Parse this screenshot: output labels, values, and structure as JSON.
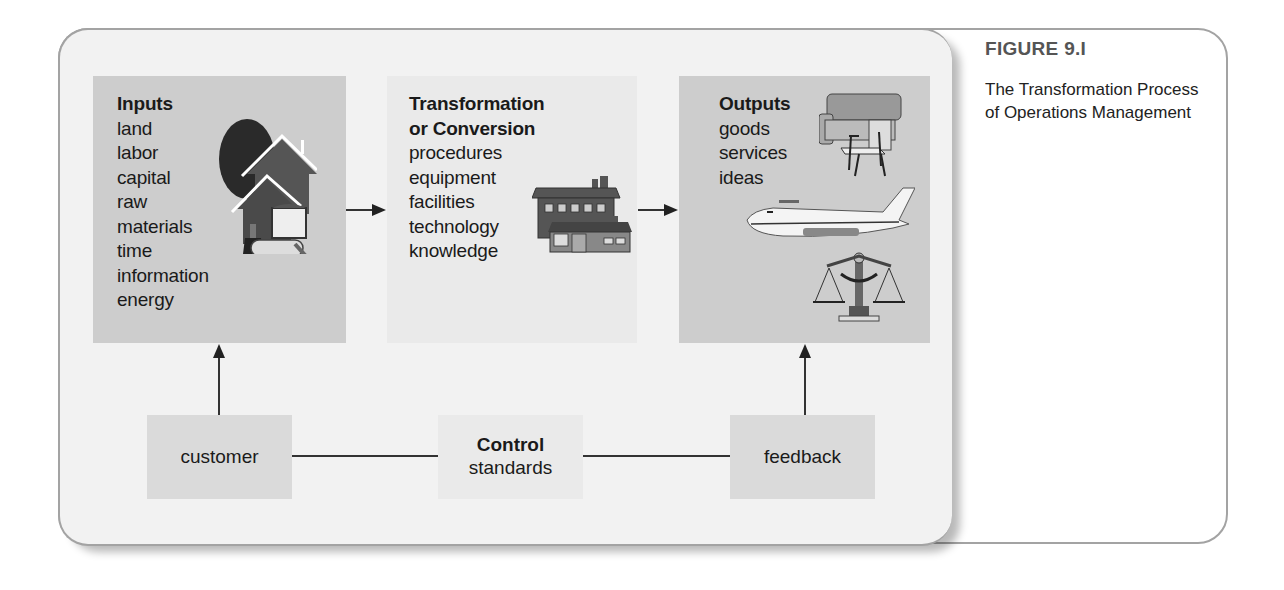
{
  "figure": {
    "label": "FIGURE 9.I",
    "title": "The Transformation Process of Operations Management"
  },
  "diagram": {
    "inputs": {
      "title": "Inputs",
      "items": [
        "land",
        "labor",
        "capital",
        "raw",
        "materials",
        "time",
        "information",
        "energy"
      ],
      "illustration": "house-tree-paint-icon"
    },
    "transformation": {
      "title_line1": "Transformation",
      "title_line2": "or Conversion",
      "items": [
        "procedures",
        "equipment",
        "facilities",
        "technology",
        "knowledge"
      ],
      "illustration": "factory-building-icon"
    },
    "outputs": {
      "title": "Outputs",
      "items": [
        "goods",
        "services",
        "ideas"
      ],
      "illustrations": [
        "furniture-icon",
        "airplane-icon",
        "scales-of-justice-icon"
      ]
    },
    "customer": {
      "label": "customer"
    },
    "control": {
      "title": "Control",
      "subtitle": "standards"
    },
    "feedback": {
      "label": "feedback"
    }
  },
  "colors": {
    "dark_box": "#cdcdcd",
    "light_box": "#eaeaea",
    "panel": "#f2f2f2",
    "frame_border": "#a3a3a3",
    "caption_label": "#555555"
  }
}
